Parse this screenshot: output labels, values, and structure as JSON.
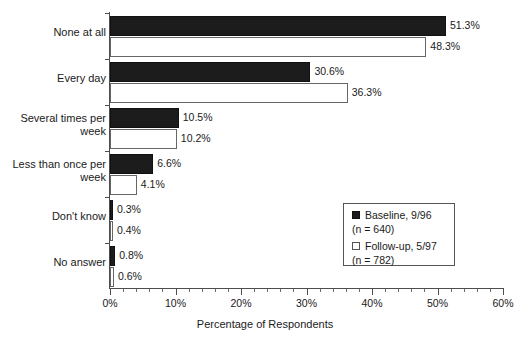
{
  "chart_data": {
    "type": "bar",
    "orientation": "horizontal",
    "title": "",
    "xlabel": "Percentage of Respondents",
    "ylabel": "",
    "xlim": [
      0,
      60
    ],
    "xticks": [
      "0%",
      "10%",
      "20%",
      "30%",
      "40%",
      "50%",
      "60%"
    ],
    "xtick_values": [
      0,
      10,
      20,
      30,
      40,
      50,
      60
    ],
    "minor_tick_step": 2,
    "grid": false,
    "legend_position": "inside-right-lower",
    "categories": [
      "None at all",
      "Every day",
      "Several times per\nweek",
      "Less than once per\nweek",
      "Don't know",
      "No answer"
    ],
    "series": [
      {
        "name": "Baseline, 9/96",
        "n_label": "(n = 640)",
        "color": "#1c1c1c",
        "values": [
          51.3,
          30.6,
          10.5,
          6.6,
          0.3,
          0.8
        ],
        "labels": [
          "51.3%",
          "30.6%",
          "10.5%",
          "6.6%",
          "0.3%",
          "0.8%"
        ]
      },
      {
        "name": "Follow-up, 5/97",
        "n_label": "(n = 782)",
        "color": "#ffffff",
        "values": [
          48.3,
          36.3,
          10.2,
          4.1,
          0.4,
          0.6
        ],
        "labels": [
          "48.3%",
          "36.3%",
          "10.2%",
          "4.1%",
          "0.4%",
          "0.6%"
        ]
      }
    ]
  },
  "legend": {
    "baseline_label": "Baseline, 9/96",
    "baseline_n": "(n = 640)",
    "followup_label": "Follow-up, 5/97",
    "followup_n": "(n = 782)"
  },
  "axis": {
    "x_title": "Percentage of Respondents"
  }
}
